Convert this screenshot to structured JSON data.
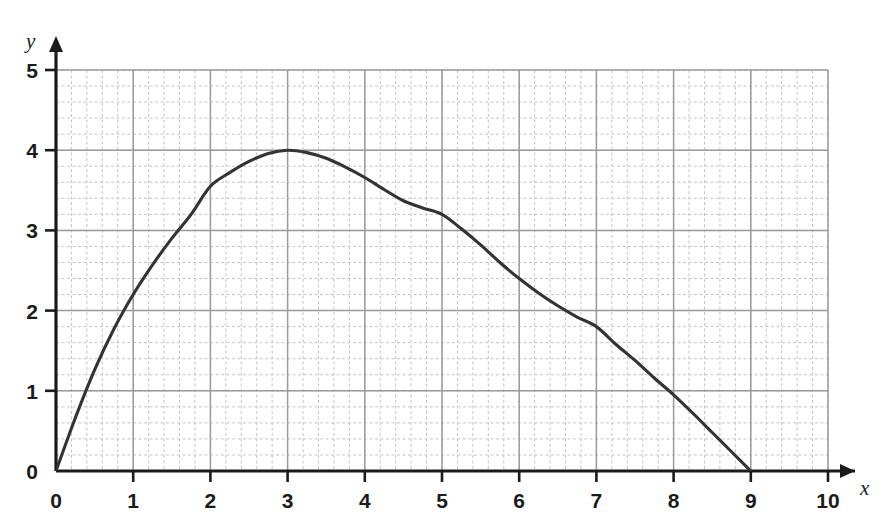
{
  "chart_data": {
    "type": "line",
    "title": "",
    "subtitle": "",
    "xlabel": "x",
    "ylabel": "y",
    "xlim": [
      0,
      10
    ],
    "ylim": [
      0,
      5
    ],
    "xticks": [
      0,
      1,
      2,
      3,
      4,
      5,
      6,
      7,
      8,
      9,
      10
    ],
    "yticks": [
      0,
      1,
      2,
      3,
      4,
      5
    ],
    "xtick_labels": [
      "0",
      "1",
      "2",
      "3",
      "4",
      "5",
      "6",
      "7",
      "8",
      "9",
      "10"
    ],
    "ytick_labels": [
      "0",
      "1",
      "2",
      "3",
      "4",
      "5"
    ],
    "grid": true,
    "grid_major_step": 1,
    "grid_minor_step": 0.2,
    "legend": false,
    "legend_position": "none",
    "annotations": [],
    "series": [
      {
        "name": "curve",
        "color": "#333333",
        "x": [
          0,
          0.25,
          0.5,
          0.75,
          1,
          1.25,
          1.5,
          1.75,
          2,
          2.25,
          2.5,
          2.75,
          3,
          3.25,
          3.5,
          3.75,
          4,
          4.25,
          4.5,
          4.75,
          5,
          5.25,
          5.5,
          5.75,
          6,
          6.25,
          6.5,
          6.75,
          7,
          7.25,
          7.5,
          7.75,
          8,
          8.25,
          8.5,
          8.75,
          9
        ],
        "values": [
          0,
          0.66,
          1.26,
          1.77,
          2.2,
          2.57,
          2.9,
          3.2,
          3.55,
          3.72,
          3.86,
          3.96,
          4.0,
          3.97,
          3.9,
          3.79,
          3.66,
          3.51,
          3.37,
          3.28,
          3.2,
          3.02,
          2.82,
          2.6,
          2.4,
          2.22,
          2.06,
          1.92,
          1.8,
          1.58,
          1.38,
          1.16,
          0.95,
          0.72,
          0.48,
          0.24,
          0
        ]
      }
    ],
    "key_points": {
      "origin": [
        0,
        0
      ],
      "maximum": [
        3,
        4
      ],
      "x_intercept": [
        9,
        0
      ]
    }
  },
  "axes": {
    "x_axis_label": "x",
    "y_axis_label": "y"
  },
  "colors": {
    "curve": "#333333",
    "axis": "#1b1b1b",
    "grid_major": "#9a9a9a",
    "grid_minor": "#c4c4c4",
    "background": "#ffffff",
    "text": "#1b1b1b"
  }
}
